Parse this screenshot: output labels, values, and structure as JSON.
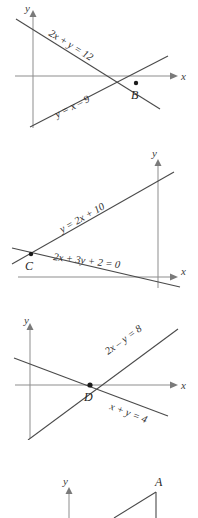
{
  "figure": {
    "kind": "coordinate-geometry-line-graphs",
    "panel_count": 4,
    "axis_color": "#8d8d8d",
    "line_color": "#4a4a4a",
    "point_color": "#1c1c1c",
    "background": "#ffffff"
  },
  "panels": [
    {
      "id": "panel-1",
      "x_axis_label": "x",
      "y_axis_label": "y",
      "point_label": "B",
      "equations": [
        {
          "text": "2x + y = 12"
        },
        {
          "text": "y = x – 9"
        }
      ]
    },
    {
      "id": "panel-2",
      "x_axis_label": "x",
      "y_axis_label": "y",
      "point_label": "C",
      "equations": [
        {
          "text": "y = 2x + 10"
        },
        {
          "text": "2x + 3y + 2 = 0"
        }
      ]
    },
    {
      "id": "panel-3",
      "x_axis_label": "x",
      "y_axis_label": "y",
      "point_label": "D",
      "equations": [
        {
          "text": "2x – y = 8"
        },
        {
          "text": "x + y = 4"
        }
      ]
    },
    {
      "id": "panel-4",
      "y_axis_label": "y",
      "point_label": "A",
      "equations": []
    }
  ]
}
